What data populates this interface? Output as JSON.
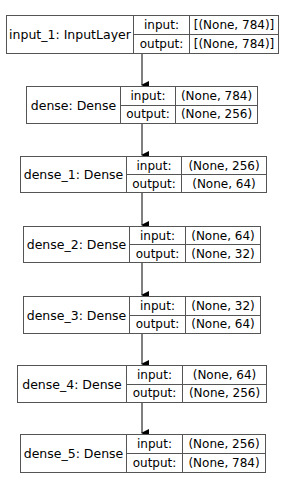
{
  "diagram": {
    "type": "keras-model-plot",
    "row_labels": {
      "input": "input:",
      "output": "output:"
    },
    "nodes": [
      {
        "name": "input_1: InputLayer",
        "input": "[(None, 784)]",
        "output": "[(None, 784)]"
      },
      {
        "name": "dense: Dense",
        "input": "(None, 784)",
        "output": "(None, 256)"
      },
      {
        "name": "dense_1: Dense",
        "input": "(None, 256)",
        "output": "(None, 64)"
      },
      {
        "name": "dense_2: Dense",
        "input": "(None, 64)",
        "output": "(None, 32)"
      },
      {
        "name": "dense_3: Dense",
        "input": "(None, 32)",
        "output": "(None, 64)"
      },
      {
        "name": "dense_4: Dense",
        "input": "(None, 64)",
        "output": "(None, 256)"
      },
      {
        "name": "dense_5: Dense",
        "input": "(None, 256)",
        "output": "(None, 784)"
      }
    ],
    "edges": [
      {
        "from": 0,
        "to": 1
      },
      {
        "from": 1,
        "to": 2
      },
      {
        "from": 2,
        "to": 3
      },
      {
        "from": 3,
        "to": 4
      },
      {
        "from": 4,
        "to": 5
      },
      {
        "from": 5,
        "to": 6
      }
    ],
    "colors": {
      "border": "#555555",
      "text": "#000000",
      "arrow": "#000000",
      "background": "#ffffff"
    }
  }
}
